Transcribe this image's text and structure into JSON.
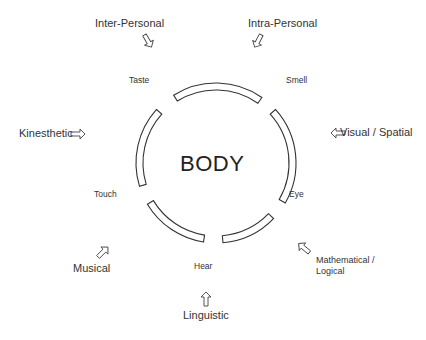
{
  "diagram": {
    "center_label": "BODY",
    "senses": [
      {
        "id": "taste",
        "label": "Taste"
      },
      {
        "id": "smell",
        "label": "Smell"
      },
      {
        "id": "eye",
        "label": "Eye"
      },
      {
        "id": "hear",
        "label": "Hear"
      },
      {
        "id": "touch",
        "label": "Touch"
      }
    ],
    "intelligences": [
      {
        "id": "inter-personal",
        "label": "Inter-Personal"
      },
      {
        "id": "intra-personal",
        "label": "Intra-Personal"
      },
      {
        "id": "kinesthetic",
        "label": "Kinesthetic"
      },
      {
        "id": "visual-spatial",
        "label": "Visual / Spatial"
      },
      {
        "id": "musical",
        "label": "Musical"
      },
      {
        "id": "mathematical-logical",
        "label_line1": "Mathematical /",
        "label_line2": "Logical"
      },
      {
        "id": "linguistic",
        "label": "Linguistic"
      }
    ],
    "ring": {
      "cx": 216,
      "cy": 163,
      "r_outer": 80,
      "r_inner": 73,
      "stroke": "#333333",
      "segments_deg": [
        [
          -122,
          -55
        ],
        [
          -42,
          30
        ],
        [
          44,
          85
        ],
        [
          99,
          149
        ],
        [
          163,
          222
        ]
      ]
    },
    "icons": [
      "outline-arrow-icon"
    ]
  }
}
